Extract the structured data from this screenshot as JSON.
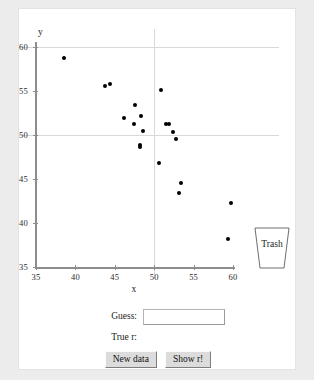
{
  "chart_data": {
    "type": "scatter",
    "title": "",
    "xlabel": "x",
    "ylabel": "y",
    "xlim": [
      35,
      60
    ],
    "ylim": [
      35,
      60
    ],
    "xticks": [
      35,
      40,
      45,
      50,
      55,
      60
    ],
    "yticks": [
      35,
      40,
      45,
      50,
      55,
      60
    ],
    "grid": true,
    "gridlines": {
      "horizontal": [
        50,
        60
      ],
      "vertical": [
        50
      ]
    },
    "legend": "none",
    "series": [
      {
        "name": "sample",
        "marker": "filled-circle",
        "color": "#000000",
        "points": [
          [
            38.6,
            58.7
          ],
          [
            43.7,
            55.6
          ],
          [
            44.4,
            55.8
          ],
          [
            46.2,
            51.9
          ],
          [
            47.6,
            53.4
          ],
          [
            47.4,
            51.3
          ],
          [
            48.3,
            52.2
          ],
          [
            48.6,
            50.5
          ],
          [
            48.2,
            48.9
          ],
          [
            48.2,
            48.6
          ],
          [
            50.8,
            55.1
          ],
          [
            51.5,
            51.2
          ],
          [
            51.9,
            51.2
          ],
          [
            52.4,
            50.3
          ],
          [
            52.8,
            49.5
          ],
          [
            50.6,
            46.8
          ],
          [
            53.4,
            44.6
          ],
          [
            53.2,
            43.4
          ],
          [
            59.7,
            42.3
          ],
          [
            59.4,
            38.2
          ]
        ]
      }
    ]
  },
  "trash": {
    "label": "Trash"
  },
  "controls": {
    "guess_label": "Guess:",
    "guess_value": "",
    "guess_placeholder": "",
    "true_r_label": "True r:",
    "true_r_value": "",
    "new_data_button": "New data",
    "show_r_button": "Show r!"
  }
}
